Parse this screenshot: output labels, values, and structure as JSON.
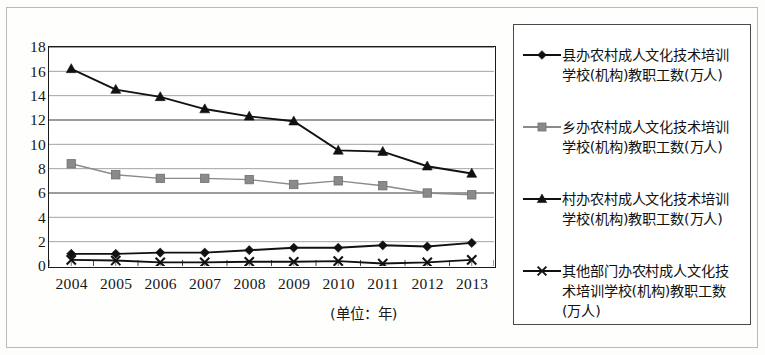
{
  "chart_data": {
    "type": "line",
    "title": "",
    "xlabel": "(单位：年)",
    "ylabel": "",
    "categories": [
      "2004",
      "2005",
      "2006",
      "2007",
      "2008",
      "2009",
      "2010",
      "2011",
      "2012",
      "2013"
    ],
    "ylim": [
      0,
      18
    ],
    "ytick_step": 2,
    "yticks": [
      "18",
      "16",
      "14",
      "12",
      "10",
      "8",
      "6",
      "4",
      "2",
      "0"
    ],
    "grid": true,
    "legend_position": "right",
    "series": [
      {
        "name": "县办农村成人文化技术培训学校(机构)教职工数(万人)",
        "marker": "diamond",
        "color": "#111111",
        "values": [
          1.0,
          1.0,
          1.1,
          1.1,
          1.3,
          1.5,
          1.5,
          1.7,
          1.6,
          1.9
        ]
      },
      {
        "name": "乡办农村成人文化技术培训学校(机构)教职工数(万人)",
        "marker": "square",
        "color": "#8a8a8a",
        "values": [
          8.4,
          7.5,
          7.2,
          7.2,
          7.1,
          6.7,
          7.0,
          6.6,
          6.0,
          5.85
        ]
      },
      {
        "name": "村办农村成人文化技术培训学校(机构)教职工数(万人)",
        "marker": "triangle",
        "color": "#111111",
        "values": [
          16.2,
          14.5,
          13.9,
          12.9,
          12.3,
          11.9,
          9.5,
          9.4,
          8.2,
          7.6
        ]
      },
      {
        "name": "其他部门办农村成人文化技术培训学校(机构)教职工数(万人)",
        "marker": "cross",
        "color": "#111111",
        "values": [
          0.5,
          0.45,
          0.3,
          0.3,
          0.35,
          0.35,
          0.4,
          0.2,
          0.3,
          0.5
        ]
      }
    ]
  },
  "legend": {
    "items": [
      {
        "label": "县办农村成人文化技术培训\n学校(机构)教职工数(万人)",
        "marker": "diamond"
      },
      {
        "label": "乡办农村成人文化技术培训\n学校(机构)教职工数(万人)",
        "marker": "square"
      },
      {
        "label": "村办农村成人文化技术培训\n学校(机构)教职工数(万人)",
        "marker": "triangle"
      },
      {
        "label": "其他部门办农村成人文化技\n术培训学校(机构)教职工数\n(万人)",
        "marker": "cross"
      }
    ]
  },
  "axis": {
    "unit_note": "(单位：年)"
  }
}
